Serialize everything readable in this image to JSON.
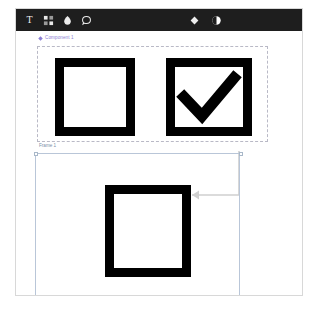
{
  "app": {
    "background_color": "#ffffff",
    "border_color": "#d8d8d8"
  },
  "toolbar": {
    "background_color": "#1e1e1e",
    "icon_color": "#ededed",
    "left_tools": [
      {
        "name": "text-tool",
        "icon": "text-icon",
        "label": "T"
      },
      {
        "name": "components-tool",
        "icon": "components-icon",
        "label": ""
      },
      {
        "name": "pen-tool",
        "icon": "pen-icon",
        "label": ""
      },
      {
        "name": "comment-tool",
        "icon": "comment-icon",
        "label": ""
      }
    ],
    "right_tools": [
      {
        "name": "component-badge",
        "icon": "diamond-icon",
        "label": ""
      },
      {
        "name": "theme-toggle",
        "icon": "contrast-circle-icon",
        "label": ""
      }
    ]
  },
  "canvas": {
    "component_group": {
      "label": "Component 1",
      "label_color": "#8b7fd4",
      "border_color": "#b9b9c6",
      "items": [
        {
          "name": "checkbox-unchecked",
          "state": "unchecked",
          "checked": false
        },
        {
          "name": "checkbox-checked",
          "state": "checked",
          "checked": true
        }
      ]
    },
    "frame": {
      "label": "Frame 1",
      "label_color": "#7a8fa8",
      "border_color": "#b9c6d8",
      "selected": true,
      "items": [
        {
          "name": "checkbox-instance",
          "state": "unchecked",
          "checked": false
        }
      ],
      "connector": {
        "name": "instance-link-arrow",
        "direction": "left",
        "color": "#cfcfcf"
      }
    }
  }
}
